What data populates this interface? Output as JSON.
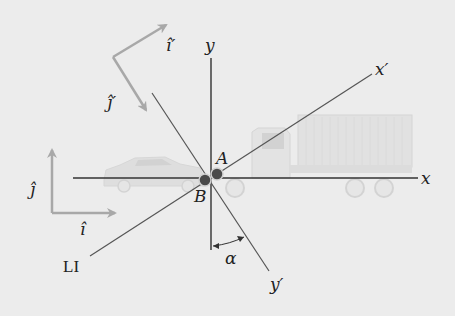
{
  "diagram": {
    "axes": {
      "x": "x",
      "y": "y",
      "x_prime": "x′",
      "y_prime": "y′"
    },
    "unit_vectors": {
      "i_hat": "î",
      "j_hat": "ĵ",
      "i_hat_prime": "î′",
      "j_hat_prime": "ĵ′"
    },
    "points": {
      "A": "A",
      "B": "B"
    },
    "angle_label": "α",
    "line_label": "LI",
    "colors": {
      "background": "#ececec",
      "axis": "#333333",
      "rotated_axis": "#555555",
      "unit_vector": "#a8a8a8",
      "point_fill": "#4a4a4a",
      "vehicle": "#d6d6d6"
    }
  }
}
